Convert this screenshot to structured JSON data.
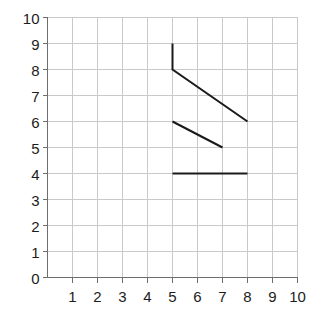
{
  "chart_data": {
    "type": "line",
    "title": "",
    "xlabel": "",
    "ylabel": "",
    "xlim": [
      0,
      10
    ],
    "ylim": [
      0,
      10
    ],
    "grid": true,
    "legend": "none",
    "x_ticks": [
      "1",
      "2",
      "3",
      "4",
      "5",
      "6",
      "7",
      "8",
      "9",
      "10"
    ],
    "x_tick_values": [
      1,
      2,
      3,
      4,
      5,
      6,
      7,
      8,
      9,
      10
    ],
    "y_ticks": [
      "0",
      "1",
      "2",
      "3",
      "4",
      "5",
      "6",
      "7",
      "8",
      "9",
      "10"
    ],
    "y_tick_values": [
      0,
      1,
      2,
      3,
      4,
      5,
      6,
      7,
      8,
      9,
      10
    ],
    "series": [
      {
        "name": "segment-upper",
        "points": [
          [
            5,
            9
          ],
          [
            5,
            8
          ],
          [
            8,
            6
          ]
        ]
      },
      {
        "name": "segment-middle",
        "points": [
          [
            5,
            6
          ],
          [
            7,
            5
          ]
        ]
      },
      {
        "name": "segment-lower",
        "points": [
          [
            5,
            4
          ],
          [
            8,
            4
          ]
        ]
      }
    ]
  },
  "style": {
    "background_color": "#ffffff",
    "grid_color": "#c9c9c9",
    "axis_color": "#6e6e6e",
    "data_line_color": "#1a1a1a",
    "label_color": "#1c1c1c"
  }
}
